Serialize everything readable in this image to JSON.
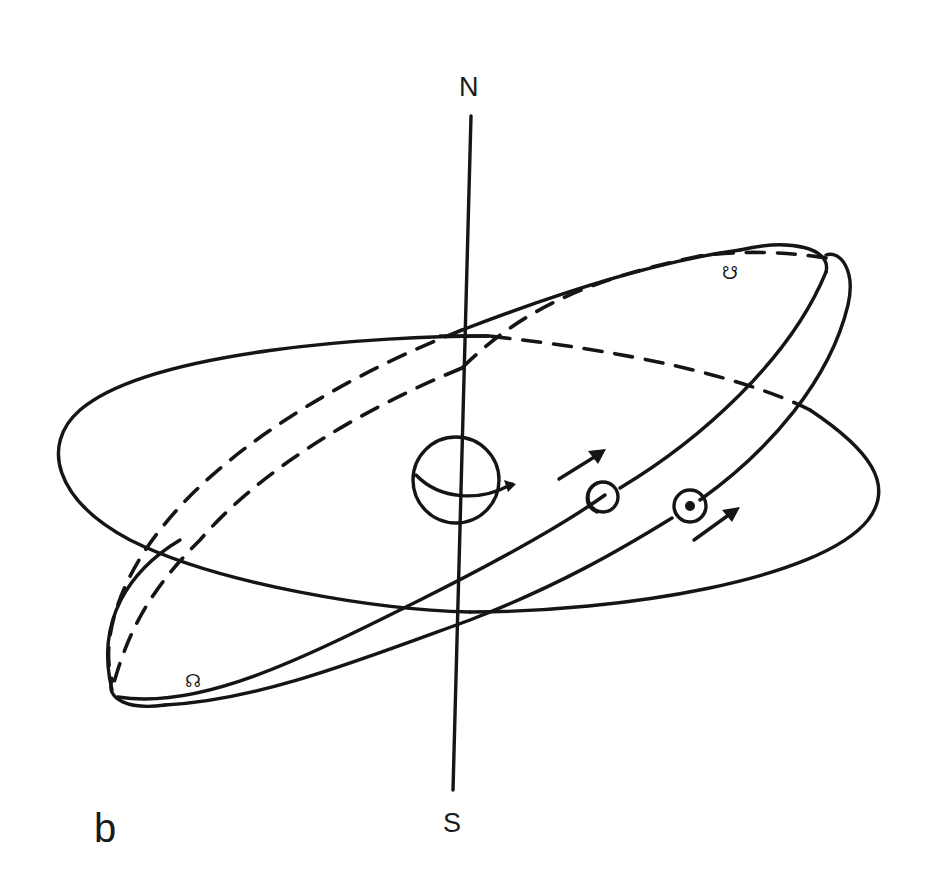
{
  "figure": {
    "panel_label": "b",
    "axis": {
      "north_label": "N",
      "south_label": "S"
    },
    "nodes": {
      "ascending_node_symbol": "☊",
      "descending_node_symbol": "☋"
    },
    "bodies": [
      {
        "name": "earth",
        "icon": "globe-icon"
      },
      {
        "name": "moon",
        "icon": "crescent-moon-icon"
      },
      {
        "name": "sun",
        "icon": "sun-symbol-icon"
      }
    ],
    "orbits": [
      {
        "name": "reference-plane-ellipse",
        "style": "solid-front, dashed-back"
      },
      {
        "name": "moon-orbit-ellipse",
        "style": "solid-front, dashed-back"
      },
      {
        "name": "sun-orbit-ellipse",
        "style": "solid-front, dashed-back"
      }
    ],
    "motion_arrows": [
      "moon-direction-arrow",
      "sun-direction-arrow"
    ],
    "colors": {
      "ink": "#151515",
      "background": "#ffffff"
    }
  }
}
